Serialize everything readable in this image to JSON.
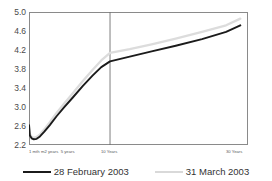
{
  "chart_data": {
    "type": "line",
    "title": "",
    "xlabel": "",
    "ylabel": "",
    "ylim": [
      2.2,
      5.0
    ],
    "yticks": [
      "5.0",
      "4.6",
      "4.2",
      "3.8",
      "3.4",
      "3.0",
      "2.6",
      "2.2"
    ],
    "ytick_values": [
      5.0,
      4.6,
      4.2,
      3.8,
      3.4,
      3.0,
      2.6,
      2.2
    ],
    "grid": false,
    "legend_position": "bottom",
    "x_tick_labels": [
      "1 mth",
      "m2 years",
      "5 years",
      "10 Years",
      "30 Years"
    ],
    "x_tick_positions": [
      0.0,
      0.055,
      0.145,
      0.37,
      1.0
    ],
    "vertical_marker_x": 0.37,
    "x": [
      0.0,
      0.004,
      0.012,
      0.022,
      0.035,
      0.05,
      0.07,
      0.095,
      0.125,
      0.16,
      0.2,
      0.245,
      0.29,
      0.33,
      0.37,
      0.46,
      0.56,
      0.67,
      0.79,
      0.9,
      0.965
    ],
    "series": [
      {
        "name": "28 February 2003",
        "color": "#1b1b1b",
        "values": [
          2.62,
          2.4,
          2.34,
          2.32,
          2.33,
          2.38,
          2.48,
          2.62,
          2.8,
          2.99,
          3.2,
          3.44,
          3.66,
          3.84,
          3.96,
          4.06,
          4.17,
          4.29,
          4.43,
          4.58,
          4.72
        ]
      },
      {
        "name": "31 March 2003",
        "color": "#dcdcdc",
        "values": [
          2.62,
          2.43,
          2.37,
          2.35,
          2.37,
          2.42,
          2.53,
          2.68,
          2.87,
          3.07,
          3.29,
          3.54,
          3.78,
          3.98,
          4.14,
          4.22,
          4.32,
          4.44,
          4.58,
          4.72,
          4.86
        ]
      }
    ]
  },
  "legend": {
    "items": [
      {
        "label": "28 February 2003",
        "color": "#1b1b1b"
      },
      {
        "label": "31 March 2003",
        "color": "#d9d9d9"
      }
    ]
  }
}
